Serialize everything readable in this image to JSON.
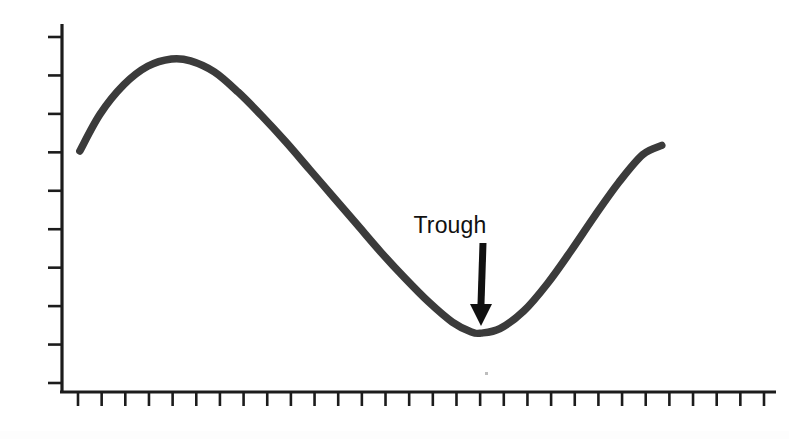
{
  "figure": {
    "background_color": "#ffffff",
    "curve_color": "#3b3b3b",
    "axis_color": "#1c1c1c",
    "annotation_color": "#111111"
  },
  "annotations": [
    {
      "name": "trough-label",
      "label": "Trough",
      "text_x": 450,
      "text_y": 233,
      "arrow_from_x": 483,
      "arrow_from_y": 243,
      "arrow_to_x": 481,
      "arrow_to_y": 326
    }
  ],
  "axes": {
    "x_axis": {
      "x_start": 62,
      "x_end": 776,
      "y": 392,
      "tick_count": 30,
      "tick_length": 14,
      "tick_labels": []
    },
    "y_axis": {
      "x": 62,
      "y_start": 24,
      "y_end": 392,
      "tick_count": 10,
      "tick_length": 14,
      "tick_labels": []
    }
  },
  "chart_data": {
    "type": "line",
    "title": "",
    "subtitle": "",
    "xlabel": "",
    "ylabel": "",
    "grid": false,
    "legend": null,
    "xlim": [
      0,
      30
    ],
    "ylim": [
      0,
      10
    ],
    "axis_tick_labels": {
      "x": [],
      "y": []
    },
    "annotations": [
      {
        "text": "Trough",
        "points_to": "curve minimum",
        "x": 17.6,
        "y": 1.6
      }
    ],
    "series": [
      {
        "name": "business-cycle-curve",
        "color": "#3b3b3b",
        "x": [
          0.75,
          1.6,
          2.6,
          3.6,
          4.6,
          5.4,
          6.4,
          7.4,
          8.4,
          9.4,
          10.4,
          11.4,
          12.4,
          13.4,
          14.4,
          15.4,
          16.4,
          17.2,
          17.6,
          18.4,
          19.4,
          20.4,
          21.4,
          22.4,
          23.4,
          24.4,
          25.2
        ],
        "y": [
          6.55,
          7.55,
          8.35,
          8.85,
          9.05,
          9.0,
          8.7,
          8.15,
          7.5,
          6.8,
          6.05,
          5.3,
          4.55,
          3.8,
          3.1,
          2.45,
          1.9,
          1.63,
          1.6,
          1.72,
          2.2,
          2.95,
          3.85,
          4.8,
          5.7,
          6.45,
          6.7
        ]
      }
    ],
    "features": {
      "peak": {
        "x": 5.0,
        "y": 9.05
      },
      "trough": {
        "x": 17.6,
        "y": 1.6
      },
      "start": {
        "x": 0.75,
        "y": 6.55
      },
      "end": {
        "x": 25.2,
        "y": 6.7
      }
    }
  }
}
